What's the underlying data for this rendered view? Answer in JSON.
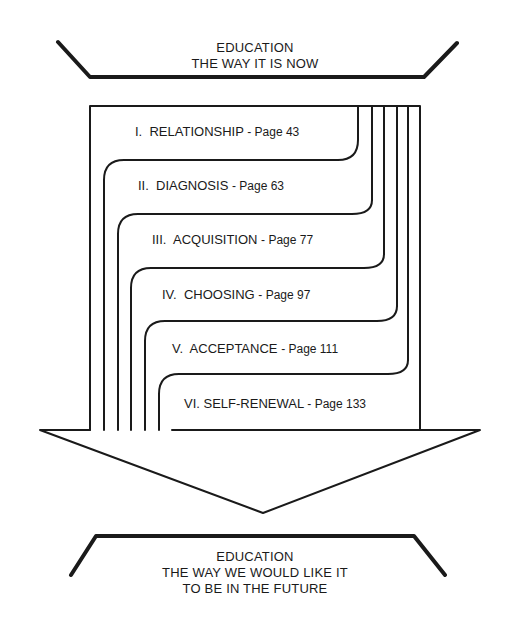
{
  "top_label": {
    "line1": "EDUCATION",
    "line2": "THE WAY IT IS NOW"
  },
  "bottom_label": {
    "line1": "EDUCATION",
    "line2": "THE WAY WE WOULD LIKE IT",
    "line3": "TO BE IN THE FUTURE"
  },
  "chapters": [
    {
      "numeral": "I.",
      "title": "RELATIONSHIP",
      "page": "- Page 43"
    },
    {
      "numeral": "II.",
      "title": "DIAGNOSIS",
      "page": "- Page 63"
    },
    {
      "numeral": "III.",
      "title": "ACQUISITION",
      "page": "- Page 77"
    },
    {
      "numeral": "IV.",
      "title": "CHOOSING",
      "page": "- Page 97"
    },
    {
      "numeral": "V.",
      "title": "ACCEPTANCE",
      "page": "- Page 111"
    },
    {
      "numeral": "VI.",
      "title": "SELF-RENEWAL",
      "page": "- Page 133"
    }
  ],
  "colors": {
    "ink": "#1a1a1a",
    "background": "#ffffff"
  }
}
